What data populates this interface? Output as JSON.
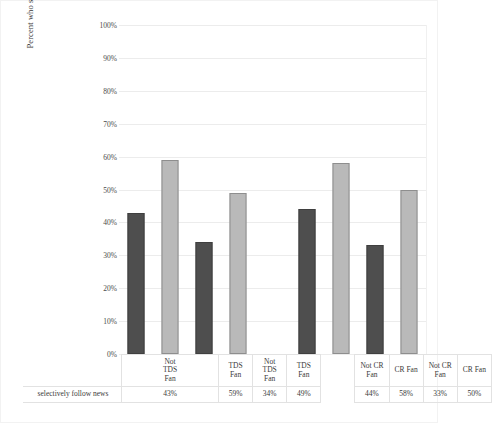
{
  "chart_data": {
    "type": "bar",
    "title": "",
    "xlabel": "",
    "ylabel": "Percent who selectively follow the news",
    "ylim": [
      0,
      100
    ],
    "grid": true,
    "legend": "none",
    "value_suffix": "%",
    "categories": [
      "Not TDS Fan",
      "TDS Fan",
      "Not TDS Fan",
      "TDS Fan",
      "",
      "Not CR Fan",
      "CR Fan",
      "Not CR Fan",
      "CR Fan"
    ],
    "category_lines": [
      [
        "Not",
        "TDS",
        "Fan"
      ],
      [
        "TDS",
        "Fan"
      ],
      [
        "Not",
        "TDS",
        "Fan"
      ],
      [
        "TDS",
        "Fan"
      ],
      [
        ""
      ],
      [
        "Not CR",
        "Fan"
      ],
      [
        "CR Fan"
      ],
      [
        "Not CR",
        "Fan"
      ],
      [
        "CR Fan"
      ]
    ],
    "values": [
      43,
      59,
      34,
      49,
      null,
      44,
      58,
      33,
      50
    ],
    "value_labels": [
      "43%",
      "59%",
      "34%",
      "49%",
      "",
      "44%",
      "58%",
      "33%",
      "50%"
    ],
    "bar_styles": [
      "dark",
      "light",
      "dark",
      "light",
      "none",
      "dark",
      "light",
      "dark",
      "light"
    ],
    "series": [
      {
        "name": "selectively follow news",
        "values": [
          43,
          59,
          34,
          49,
          null,
          44,
          58,
          33,
          50
        ]
      }
    ],
    "ytick_labels": [
      "100%",
      "90%",
      "80%",
      "70%",
      "60%",
      "50%",
      "40%",
      "30%",
      "20%",
      "10%",
      "0%"
    ],
    "ytick_values": [
      100,
      90,
      80,
      70,
      60,
      50,
      40,
      30,
      20,
      10,
      0
    ],
    "table_row_header": "selectively follow news"
  },
  "colors": {
    "bar_dark": "#4e4e4e",
    "bar_dark_edge": "#3f3f3f",
    "bar_light": "#b9b9b9",
    "bar_light_edge": "#8e8e8e",
    "gridline": "#ececec",
    "table_border": "#e2e2e2",
    "text": "#3a3a3a",
    "background": "#ffffff"
  }
}
